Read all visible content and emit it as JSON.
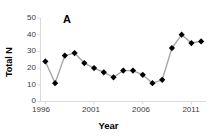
{
  "figure": {
    "panel_label": "A",
    "background": "#ffffff"
  },
  "axis": {
    "y_title": "Total N",
    "x_title": "Year",
    "y_ticks": [
      "0",
      "10",
      "20",
      "30",
      "40",
      "50"
    ],
    "x_ticks": [
      "1996",
      "2001",
      "2006",
      "2011"
    ],
    "axis_color": "#d9d9d9",
    "tick_text_color": "#3a3a3a"
  },
  "chart_data": {
    "type": "line",
    "title": "A",
    "xlabel": "Year",
    "ylabel": "Total N",
    "xlim": [
      1995.5,
      2012.5
    ],
    "ylim": [
      0,
      50
    ],
    "yticks": [
      0,
      10,
      20,
      30,
      40,
      50
    ],
    "xticks": [
      1996,
      2001,
      2006,
      2011
    ],
    "grid": false,
    "legend": "none",
    "marker": "filled-diamond",
    "marker_color": "#000000",
    "line_color": "#a6a6a6",
    "x": [
      1996,
      1997,
      1998,
      1999,
      2000,
      2001,
      2002,
      2003,
      2004,
      2005,
      2006,
      2007,
      2008,
      2009,
      2010,
      2011,
      2012
    ],
    "values": [
      24,
      11,
      27.5,
      29,
      23,
      20,
      17.5,
      14.5,
      18.5,
      18.5,
      16,
      11,
      13,
      32,
      40,
      35,
      36
    ],
    "series": [
      {
        "name": "Total N",
        "values": [
          24,
          11,
          27.5,
          29,
          23,
          20,
          17.5,
          14.5,
          18.5,
          18.5,
          16,
          11,
          13,
          32,
          40,
          35,
          36
        ]
      }
    ]
  }
}
